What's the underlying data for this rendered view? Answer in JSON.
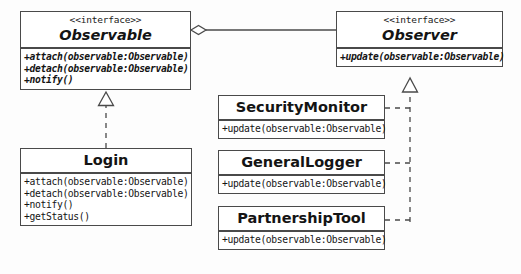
{
  "diagram": {
    "stereotype_label": "<<interface>>",
    "colors": {
      "background": "#fdfdfd",
      "box_fill": "#ffffff",
      "line": "#4a4a4a",
      "text": "#141414"
    },
    "classes": [
      {
        "id": "observable",
        "stereotype": "<<interface>>",
        "name": "Observable",
        "abstract": true,
        "operations": [
          "+attach(observable:Observable)",
          "+detach(observable:Observable)",
          "+notify()"
        ]
      },
      {
        "id": "observer",
        "stereotype": "<<interface>>",
        "name": "Observer",
        "abstract": true,
        "operations": [
          "+update(observable:Observable)"
        ]
      },
      {
        "id": "login",
        "stereotype": "",
        "name": "Login",
        "abstract": false,
        "operations": [
          "+attach(observable:Observable)",
          "+detach(observable:Observable)",
          "+notify()",
          "+getStatus()"
        ]
      },
      {
        "id": "securitymonitor",
        "stereotype": "",
        "name": "SecurityMonitor",
        "abstract": false,
        "operations": [
          "+update(observable:Observable)"
        ]
      },
      {
        "id": "generallogger",
        "stereotype": "",
        "name": "GeneralLogger",
        "abstract": false,
        "operations": [
          "+update(observable:Observable)"
        ]
      },
      {
        "id": "partnershiptool",
        "stereotype": "",
        "name": "PartnershipTool",
        "abstract": false,
        "operations": [
          "+update(observable:Observable)"
        ]
      }
    ],
    "relationships": [
      {
        "id": "rel-aggregation",
        "type": "aggregation",
        "style": "solid",
        "marker": "hollow-diamond",
        "from": "Observable",
        "to": "Observer",
        "label": ""
      },
      {
        "id": "rel-login-observable",
        "type": "realization",
        "style": "dashed",
        "marker": "hollow-triangle",
        "from": "Login",
        "to": "Observable",
        "label": ""
      },
      {
        "id": "rel-securitymonitor-observer",
        "type": "realization",
        "style": "dashed",
        "marker": "hollow-triangle",
        "from": "SecurityMonitor",
        "to": "Observer",
        "label": ""
      },
      {
        "id": "rel-generallogger-observer",
        "type": "realization",
        "style": "dashed",
        "marker": "hollow-triangle",
        "from": "GeneralLogger",
        "to": "Observer",
        "label": ""
      },
      {
        "id": "rel-partnershiptool-observer",
        "type": "realization",
        "style": "dashed",
        "marker": "hollow-triangle",
        "from": "PartnershipTool",
        "to": "Observer",
        "label": ""
      }
    ]
  }
}
